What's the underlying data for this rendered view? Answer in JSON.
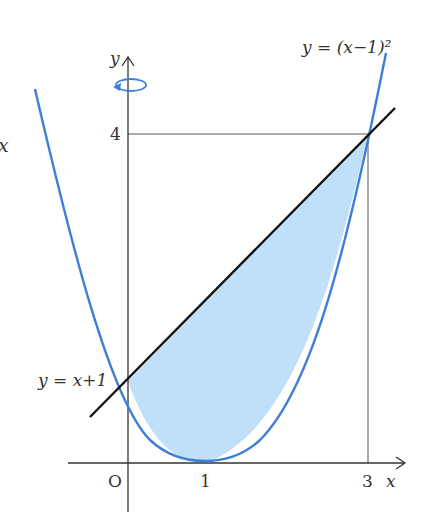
{
  "diagram": {
    "curve_label": "y = (x−1)²",
    "line_label": "y = x+1",
    "axis_x_label": "x",
    "axis_y_label": "y",
    "origin_label": "O",
    "tick_x_1": "1",
    "tick_x_3": "3",
    "tick_y_4": "4",
    "partial_left_text": "x",
    "colors": {
      "curve": "#3d7fd6",
      "fill": "#bfe0f8",
      "line": "#111111",
      "axis": "#333333",
      "guide": "#555555"
    },
    "rotation_indicator": "rotation about y-axis"
  }
}
